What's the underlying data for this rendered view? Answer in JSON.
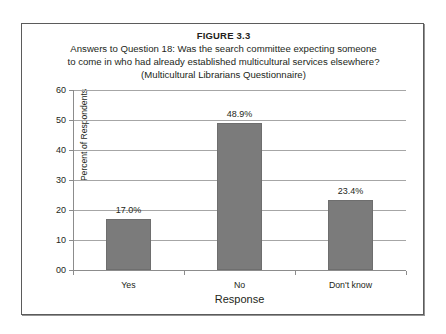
{
  "figure": {
    "number": "FIGURE 3.3",
    "title_lines": [
      "Answers to Question 18: Was the search committee expecting someone",
      "to come in who had already established multicultural services elsewhere?",
      "(Multicultural Librarians Questionnaire)"
    ]
  },
  "colors": {
    "bar_fill": "#7b7b7b",
    "bar_edge": "#6e6e6e",
    "gridline": "#a6a6a6",
    "axis": "#8c8c8c",
    "frame": "#5b5b5b",
    "text": "#231f20",
    "background": "#ffffff"
  },
  "chart_data": {
    "type": "bar",
    "categories": [
      "Yes",
      "No",
      "Don't know"
    ],
    "values": [
      17.0,
      48.9,
      23.4
    ],
    "data_labels": [
      "17.0%",
      "48.9%",
      "23.4%"
    ],
    "xlabel": "Response",
    "ylabel": "Percent of Respondents",
    "ylim": [
      0,
      60
    ],
    "ytick_values": [
      0,
      10,
      20,
      30,
      40,
      50,
      60
    ],
    "ytick_labels": [
      "00",
      "10",
      "20",
      "30",
      "40",
      "50",
      "60"
    ],
    "grid": "horizontal",
    "legend": "none"
  }
}
